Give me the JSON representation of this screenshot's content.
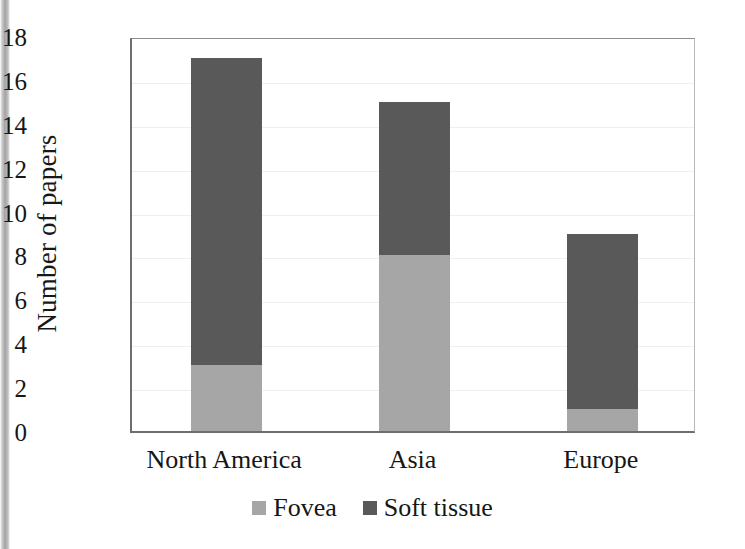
{
  "chart_data": {
    "type": "bar",
    "subtype": "stacked-vertical",
    "title": "",
    "subtitle": "",
    "xlabel": "",
    "ylabel": "Number of papers",
    "categories": [
      "North America",
      "Asia",
      "Europe"
    ],
    "series": [
      {
        "name": "Fovea",
        "color": "#a6a6a6",
        "values": [
          3,
          8,
          1
        ]
      },
      {
        "name": "Soft tissue",
        "color": "#595959",
        "values": [
          14,
          7,
          8
        ]
      }
    ],
    "totals": [
      17,
      15,
      9
    ],
    "ylim": [
      0,
      18
    ],
    "ytick_step": 2,
    "ytick_labels": [
      "18",
      "16",
      "14",
      "12",
      "10",
      "8",
      "6",
      "4",
      "2",
      "0"
    ],
    "ytick_values": [
      18,
      16,
      14,
      12,
      10,
      8,
      6,
      4,
      2,
      0
    ],
    "grid": "horizontal-faint",
    "legend_position": "bottom-center",
    "legend_entries": [
      {
        "label": "Fovea",
        "color": "#a6a6a6"
      },
      {
        "label": "Soft tissue",
        "color": "#595959"
      }
    ],
    "background_color": "#ffffff",
    "axis_color": "#6e6e6e"
  }
}
